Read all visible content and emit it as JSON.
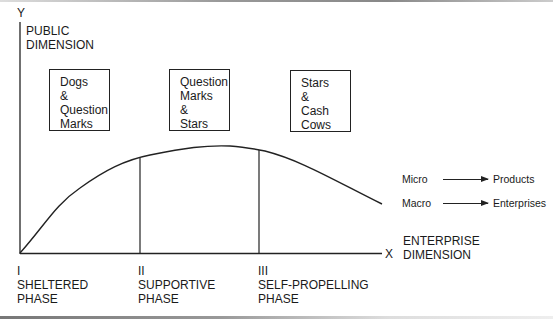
{
  "axes": {
    "y_letter": "Y",
    "y_label_1": "PUBLIC",
    "y_label_2": "DIMENSION",
    "x_letter": "X",
    "x_label_1": "ENTERPRISE",
    "x_label_2": "DIMENSION"
  },
  "boxes": [
    {
      "lines": [
        "Dogs",
        "&",
        "Question",
        "Marks"
      ]
    },
    {
      "lines": [
        "Question",
        "Marks",
        "&",
        "Stars"
      ]
    },
    {
      "lines": [
        "Stars",
        "&",
        "Cash",
        "Cows"
      ]
    }
  ],
  "phases": [
    {
      "numeral": "I",
      "name": "SHELTERED",
      "suffix": "PHASE"
    },
    {
      "numeral": "II",
      "name": "SUPPORTIVE",
      "suffix": "PHASE"
    },
    {
      "numeral": "III",
      "name": "SELF-PROPELLING",
      "suffix": "PHASE"
    }
  ],
  "legend": [
    {
      "from": "Micro",
      "to": "Products"
    },
    {
      "from": "Macro",
      "to": "Enterprises"
    }
  ],
  "curve": {
    "description": "Rising then gently falling curve from origin across three phases",
    "points": [
      [
        20,
        253
      ],
      [
        60,
        205
      ],
      [
        100,
        175
      ],
      [
        140,
        157
      ],
      [
        180,
        149
      ],
      [
        220,
        146
      ],
      [
        259,
        150
      ],
      [
        300,
        163
      ],
      [
        340,
        182
      ],
      [
        382,
        204
      ]
    ]
  }
}
